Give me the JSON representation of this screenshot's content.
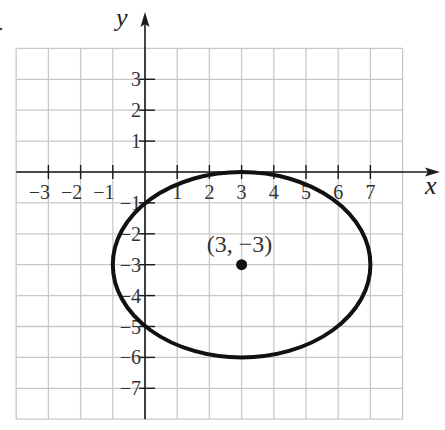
{
  "chart_data": {
    "type": "line",
    "title": "",
    "xlabel": "x",
    "ylabel": "y",
    "xlim": [
      -4,
      8
    ],
    "ylim": [
      -8,
      4
    ],
    "grid": true,
    "x_ticks": [
      -3,
      -2,
      -1,
      1,
      2,
      3,
      4,
      5,
      6,
      7
    ],
    "y_ticks": [
      3,
      2,
      1,
      -1,
      -2,
      -3,
      -4,
      -5,
      -6,
      -7
    ],
    "x_tick_labels": [
      "−3",
      "−2",
      "−1",
      "1",
      "2",
      "3",
      "4",
      "5",
      "6",
      "7"
    ],
    "y_tick_labels": [
      "3",
      "2",
      "1",
      "−1",
      "−2",
      "−3",
      "−4",
      "−5",
      "−6",
      "−7"
    ],
    "series": [
      {
        "name": "ellipse",
        "shape": "ellipse",
        "center": [
          3,
          -3
        ],
        "semi_axis_x": 4,
        "semi_axis_y": 3,
        "equation": "(x-3)^2/16 + (y+3)^2/9 = 1",
        "key_points": [
          [
            -1,
            -3
          ],
          [
            7,
            -3
          ],
          [
            3,
            0
          ],
          [
            3,
            -6
          ]
        ]
      }
    ],
    "annotations": [
      {
        "text": "(3, −3)",
        "point": [
          3,
          -3
        ],
        "marker": "filled-dot"
      }
    ],
    "colors": {
      "grid": "#c8c8c8",
      "axis": "#1a1a1a",
      "curve": "#111111"
    }
  },
  "labels": {
    "x_axis": "x",
    "y_axis": "y",
    "center_point": "(3, −3)"
  }
}
